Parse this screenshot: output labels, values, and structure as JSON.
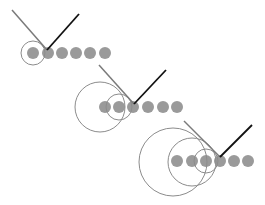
{
  "colors": {
    "background": "#ffffff",
    "dot": "#9a9a9a",
    "circle": "#8c8c8c",
    "gray_line": "#7a7a7a",
    "black_line": "#111111"
  },
  "dot_radius": 6,
  "groups": [
    {
      "name": "step-1",
      "dots_y": 53,
      "dots_x": [
        33,
        48,
        62,
        76,
        90,
        105
      ],
      "circles": [
        {
          "cx": 33,
          "cy": 53,
          "r": 12
        }
      ],
      "gray_line": {
        "x1": 12,
        "y1": 10,
        "x2": 47,
        "y2": 50
      },
      "black_line": {
        "x1": 47,
        "y1": 50,
        "x2": 79,
        "y2": 14
      }
    },
    {
      "name": "step-2",
      "dots_y": 107,
      "dots_x": [
        105,
        119,
        133,
        148,
        163,
        177
      ],
      "circles": [
        {
          "cx": 100,
          "cy": 107,
          "r": 25
        },
        {
          "cx": 119,
          "cy": 107,
          "r": 13
        }
      ],
      "gray_line": {
        "x1": 99,
        "y1": 65,
        "x2": 134,
        "y2": 104
      },
      "black_line": {
        "x1": 134,
        "y1": 104,
        "x2": 166,
        "y2": 70
      }
    },
    {
      "name": "step-3",
      "dots_y": 161,
      "dots_x": [
        177,
        192,
        206,
        220,
        234,
        248
      ],
      "circles": [
        {
          "cx": 173,
          "cy": 162,
          "r": 34
        },
        {
          "cx": 192,
          "cy": 162,
          "r": 24
        },
        {
          "cx": 206,
          "cy": 161,
          "r": 12
        }
      ],
      "gray_line": {
        "x1": 184,
        "y1": 121,
        "x2": 220,
        "y2": 157
      },
      "black_line": {
        "x1": 220,
        "y1": 157,
        "x2": 252,
        "y2": 125
      }
    }
  ]
}
